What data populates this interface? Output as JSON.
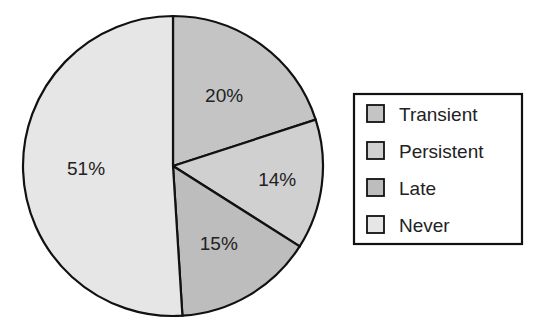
{
  "chart_data": {
    "type": "pie",
    "title": "",
    "start": "12 o'clock",
    "direction": "clockwise",
    "categories": [
      "Transient",
      "Persistent",
      "Late",
      "Never"
    ],
    "values": [
      20,
      14,
      15,
      51
    ],
    "labels": [
      "20%",
      "14%",
      "15%",
      "51%"
    ],
    "colors": [
      "#c4c4c4",
      "#d0d0d0",
      "#bdbdbd",
      "#e6e6e6"
    ],
    "legend": {
      "placement": "right",
      "entries": [
        "Transient",
        "Persistent",
        "Late",
        "Never"
      ]
    }
  }
}
